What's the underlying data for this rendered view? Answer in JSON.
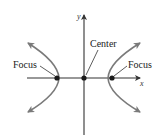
{
  "diagram": {
    "type": "hyperbola",
    "orientation": "horizontal",
    "axes": {
      "x_label": "x",
      "y_label": "y"
    },
    "labels": {
      "center": "Center",
      "focus_left": "Focus",
      "focus_right": "Focus"
    },
    "points": [
      {
        "name": "focus-left",
        "label": "Focus"
      },
      {
        "name": "center",
        "label": "Center"
      },
      {
        "name": "focus-right",
        "label": "Focus"
      }
    ],
    "colors": {
      "curve": "#7a7a7a",
      "axis": "#333333",
      "point": "#1a1a1a",
      "text": "#222222"
    }
  }
}
